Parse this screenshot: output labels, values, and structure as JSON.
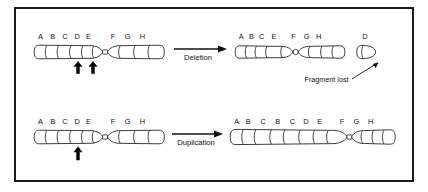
{
  "figure": {
    "background_color": "#ffffff",
    "border_color": "#1a1a1a",
    "ink_color": "#111111"
  },
  "rows": [
    {
      "id": "deletion",
      "process_label": "Deletion",
      "before": {
        "name": "normal-chromosome",
        "short_arm_bands": [
          "A",
          "B",
          "C",
          "D",
          "E"
        ],
        "long_arm_bands": [
          "F",
          "G",
          "H"
        ],
        "break_markers": 2,
        "break_marker_bands": [
          "C",
          "E"
        ]
      },
      "after": {
        "name": "deleted-chromosome",
        "short_arm_bands": [
          "A",
          "B",
          "C",
          "E"
        ],
        "long_arm_bands": [
          "F",
          "G",
          "H"
        ]
      },
      "fragment": {
        "name": "lost-fragment",
        "label": "D",
        "callout": "Fragment lost"
      }
    },
    {
      "id": "duplication",
      "process_label": "Duplication",
      "before": {
        "name": "normal-chromosome",
        "short_arm_bands": [
          "A",
          "B",
          "C",
          "D",
          "E"
        ],
        "long_arm_bands": [
          "F",
          "G",
          "H"
        ],
        "break_markers": 1,
        "break_marker_bands": [
          "C"
        ]
      },
      "after": {
        "name": "duplicated-chromosome",
        "short_arm_bands": [
          "A",
          "B",
          "C",
          "B",
          "C",
          "D",
          "E"
        ],
        "long_arm_bands": [
          "F",
          "G",
          "H"
        ]
      }
    }
  ],
  "labels": {
    "r1_before_bands": [
      "A",
      "B",
      "C",
      "D",
      "E",
      "F",
      "G",
      "H"
    ],
    "r1_after_bands": [
      "A",
      "B",
      "C",
      "E",
      "F",
      "G",
      "H"
    ],
    "r1_fragment": "D",
    "r1_callout": "Fragment lost",
    "r1_process": "Deletion",
    "r2_before_bands": [
      "A",
      "B",
      "C",
      "D",
      "E",
      "F",
      "G",
      "H"
    ],
    "r2_after_bands": [
      "A",
      "B",
      "C",
      "B",
      "C",
      "D",
      "E",
      "F",
      "G",
      "H"
    ],
    "r2_process": "Duplication"
  }
}
